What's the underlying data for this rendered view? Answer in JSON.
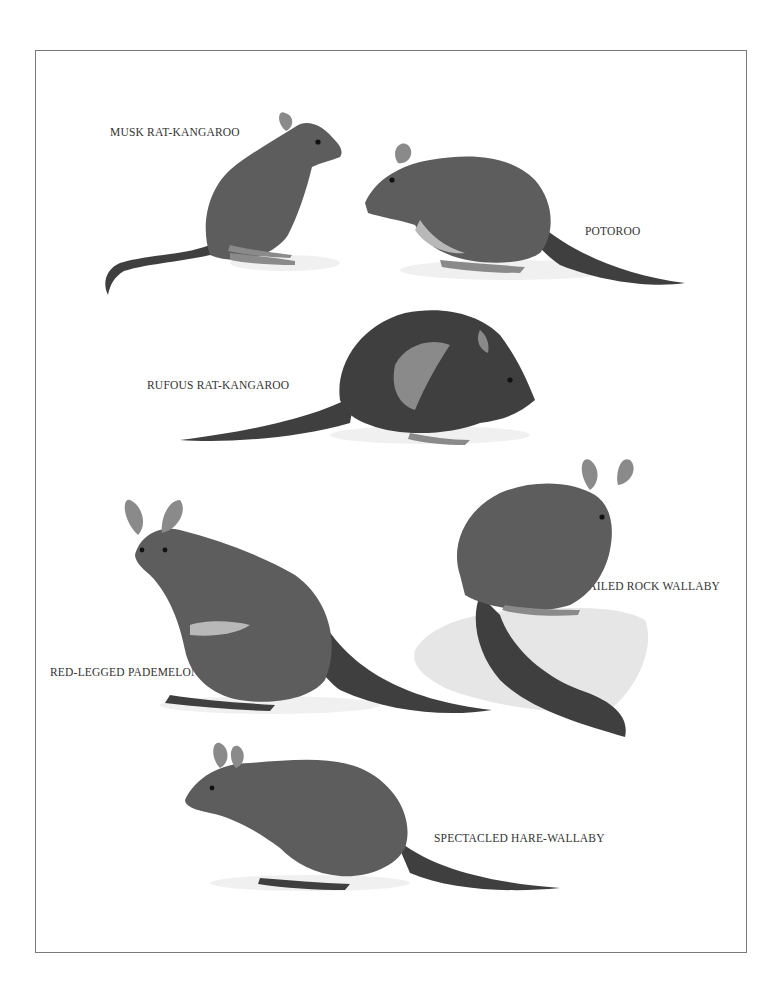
{
  "plate": {
    "labels": {
      "musk_rat_kangaroo": "MUSK RAT-KANGAROO",
      "potoroo": "POTOROO",
      "rufous_rat_kangaroo": "RUFOUS RAT-KANGAROO",
      "ring_tailed_rock_wallaby": "RING-TAILED ROCK WALLABY",
      "red_legged_pademelon": "RED-LEGGED PADEMELON",
      "spectacled_hare_wallaby": "SPECTACLED HARE-WALLABY"
    }
  }
}
